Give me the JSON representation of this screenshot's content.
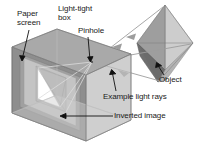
{
  "figure": {
    "background": "#ffffff",
    "labels": {
      "paper_screen": "Paper\nscreen",
      "light_tight_box": "Light-tight\nbox",
      "pinhole": "Pinhole",
      "object": "Object",
      "example_light_rays": "Example light rays",
      "inverted_image": "Inverted image"
    },
    "icons": {
      "leader_line": "leader-line-icon",
      "ray_arrow": "ray-arrowhead-icon"
    },
    "colors": {
      "text": "#1a1a1a",
      "leader": "#111111",
      "box_top": "#a9a9a9",
      "box_front_right": "#b9b9b9",
      "box_left_outer": "#8f8f8f",
      "box_left_inner": "#9c9c9c",
      "screen_paper": "#c3c3c3",
      "screen_image": "#ffffff",
      "object_dark": "#707070",
      "object_mid": "#9a9a9a",
      "object_light": "#cfcfcf",
      "ray": "#9a9a9a",
      "wire": "#c9c9c9"
    },
    "geometry": {
      "box_note": "cube drawn in oblique projection, open right side, screen on inner left wall",
      "object_note": "vertical octahedron to the upper right of the box",
      "ray_count": 3
    }
  }
}
